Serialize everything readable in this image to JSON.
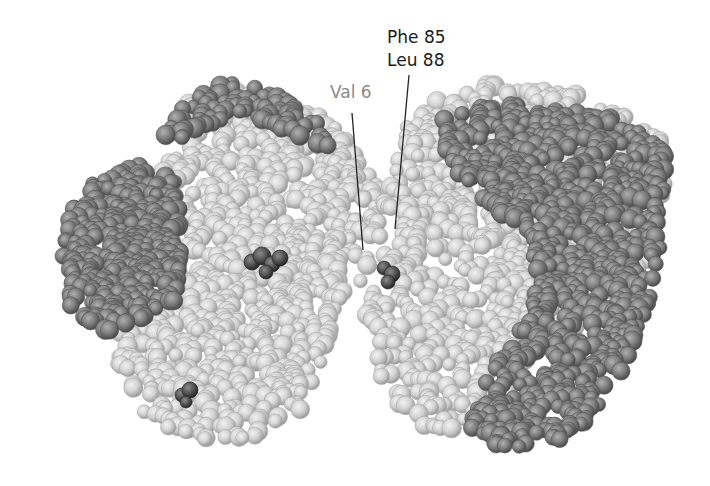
{
  "figure": {
    "type": "space-filling protein model",
    "background_color": "#ffffff",
    "subunits": [
      {
        "name": "left-alpha-chain",
        "shade": "dark",
        "color": "#7a7a7a"
      },
      {
        "name": "left-beta-chain",
        "shade": "light",
        "color": "#cfcfcf"
      },
      {
        "name": "right-beta-chain",
        "shade": "light",
        "color": "#cfcfcf"
      },
      {
        "name": "right-alpha-chain",
        "shade": "dark",
        "color": "#7a7a7a"
      }
    ],
    "highlight_color": "#4a4a4a"
  },
  "labels": {
    "val6": {
      "text": "Val 6",
      "color": "#8a8a8a"
    },
    "phe_leu": {
      "line1": "Phe 85",
      "line2": "Leu 88",
      "color": "#1a1a1a"
    }
  }
}
